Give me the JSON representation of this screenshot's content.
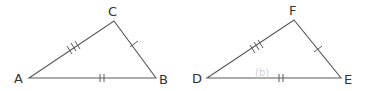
{
  "figure": {
    "triangles": [
      {
        "name": "ABC",
        "vertices": {
          "A": {
            "label": "A",
            "x": 29,
            "y": 78,
            "lx": 14,
            "ly": 83
          },
          "B": {
            "label": "B",
            "x": 156,
            "y": 78,
            "lx": 159,
            "ly": 84
          },
          "C": {
            "label": "C",
            "x": 114,
            "y": 21,
            "lx": 108,
            "ly": 16
          }
        },
        "sides": [
          {
            "name": "AC",
            "ticks": 3
          },
          {
            "name": "CB",
            "ticks": 1
          },
          {
            "name": "AB",
            "ticks": 2
          }
        ]
      },
      {
        "name": "DEF",
        "vertices": {
          "D": {
            "label": "D",
            "x": 207,
            "y": 78,
            "lx": 192,
            "ly": 83
          },
          "E": {
            "label": "E",
            "x": 341,
            "y": 78,
            "lx": 344,
            "ly": 84
          },
          "F": {
            "label": "F",
            "x": 294,
            "y": 20,
            "lx": 289,
            "ly": 15
          }
        },
        "sides": [
          {
            "name": "DF",
            "ticks": 3
          },
          {
            "name": "FE",
            "ticks": 1
          },
          {
            "name": "DE",
            "ticks": 2
          }
        ]
      }
    ],
    "watermark": "(b)",
    "colors": {
      "stroke": "#5a5a5a",
      "label": "#333333",
      "watermark": "#d2d2d2"
    }
  }
}
